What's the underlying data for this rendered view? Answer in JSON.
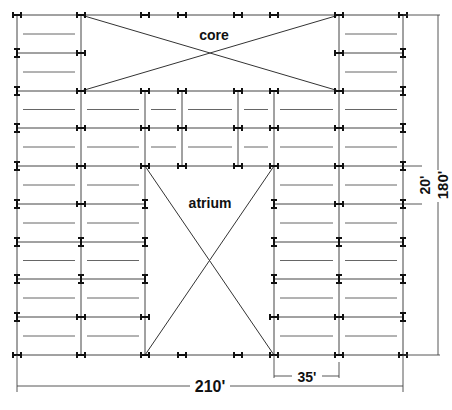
{
  "diagram": {
    "labels": {
      "core": "core",
      "atrium": "atrium"
    },
    "dimensions": {
      "overall_width": "210'",
      "overall_depth": "180'",
      "bay_width": "35'",
      "bay_depth": "20'"
    },
    "grid": {
      "columns": 8,
      "rows": 10,
      "column_lines": [
        "A",
        "B",
        "C",
        "D",
        "E",
        "F",
        "G",
        "H"
      ],
      "row_lines": [
        1,
        2,
        3,
        4,
        5,
        6,
        7,
        8,
        9,
        10
      ]
    },
    "openings": [
      {
        "name": "core",
        "from_col": 1,
        "to_col": 6,
        "from_row": 0,
        "to_row": 2
      },
      {
        "name": "atrium",
        "from_col": 2,
        "to_col": 5,
        "from_row": 4,
        "to_row": 9
      }
    ],
    "colors": {
      "line": "#444444",
      "text": "#111111",
      "background": "#ffffff"
    }
  }
}
